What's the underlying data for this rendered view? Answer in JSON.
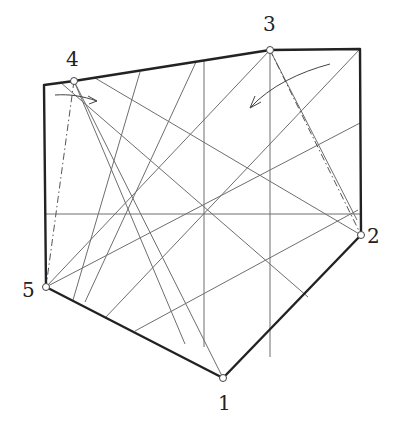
{
  "diagram": {
    "type": "folding-crease-pattern",
    "vertices": [
      {
        "id": "1",
        "label": "1",
        "x": 223,
        "y": 378,
        "label_x": 218,
        "label_y": 410
      },
      {
        "id": "2",
        "label": "2",
        "x": 361,
        "y": 235,
        "label_x": 367,
        "label_y": 243
      },
      {
        "id": "3",
        "label": "3",
        "x": 270,
        "y": 50,
        "label_x": 263,
        "label_y": 31
      },
      {
        "id": "4",
        "label": "4",
        "x": 74,
        "y": 81,
        "label_x": 66,
        "label_y": 66
      },
      {
        "id": "5",
        "label": "5",
        "x": 46,
        "y": 287,
        "label_x": 22,
        "label_y": 297
      }
    ],
    "outline": [
      [
        44,
        85
      ],
      [
        74,
        81
      ],
      [
        270,
        50
      ],
      [
        360,
        49
      ],
      [
        361,
        235
      ],
      [
        223,
        378
      ],
      [
        46,
        287
      ],
      [
        44,
        85
      ]
    ],
    "creases": [
      [
        270,
        50,
        270,
        357
      ],
      [
        204,
        60,
        204,
        347
      ],
      [
        46,
        214,
        360,
        214
      ],
      [
        74,
        81,
        223,
        378
      ],
      [
        60,
        82,
        308,
        297
      ],
      [
        95,
        78,
        361,
        235
      ],
      [
        140,
        72,
        73,
        300
      ],
      [
        196,
        62,
        85,
        302
      ],
      [
        270,
        50,
        46,
        287
      ],
      [
        360,
        49,
        105,
        318
      ],
      [
        360,
        123,
        46,
        287
      ],
      [
        358,
        210,
        135,
        331
      ],
      [
        74,
        81,
        185,
        344
      ],
      [
        270,
        50,
        357,
        220
      ]
    ],
    "dashdot_lines": [
      [
        74,
        81,
        46,
        287
      ],
      [
        270,
        50,
        361,
        235
      ]
    ],
    "arrows": [
      {
        "id": "arrow-near-4",
        "path": "M55,95 C70,94 82,96 97,101",
        "head": [
          [
            97,
            101
          ],
          [
            88,
            96
          ],
          [
            97,
            101
          ],
          [
            89,
            104
          ]
        ]
      },
      {
        "id": "arrow-near-3",
        "path": "M330,64 C300,72 270,86 250,108",
        "head": [
          [
            250,
            108
          ],
          [
            255,
            96
          ],
          [
            250,
            108
          ],
          [
            261,
            102
          ]
        ]
      }
    ]
  }
}
